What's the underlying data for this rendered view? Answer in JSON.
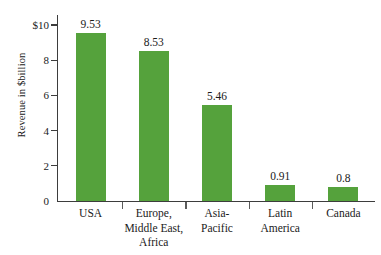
{
  "chart_data": {
    "type": "bar",
    "title": "",
    "subtitle": "",
    "xlabel": "",
    "ylabel": "Revenue in $billion",
    "ylim": [
      0,
      10
    ],
    "grid": false,
    "legend": "none",
    "y_ticks": [
      {
        "value": 10,
        "label": "$10"
      },
      {
        "value": 8,
        "label": "8"
      },
      {
        "value": 6,
        "label": "6"
      },
      {
        "value": 4,
        "label": "4"
      },
      {
        "value": 2,
        "label": "2"
      },
      {
        "value": 0,
        "label": "0"
      }
    ],
    "categories": [
      "USA",
      "Europe,\nMiddle East,\nAfrica",
      "Asia-\nPacific",
      "Latin\nAmerica",
      "Canada"
    ],
    "values": [
      9.53,
      8.53,
      5.46,
      0.91,
      0.8
    ],
    "value_labels": [
      "9.53",
      "8.53",
      "5.46",
      "0.91",
      "0.8"
    ],
    "bar_color": "#55a23c",
    "axis_color": "#3d3d3d",
    "background_color": "#ffffff"
  }
}
